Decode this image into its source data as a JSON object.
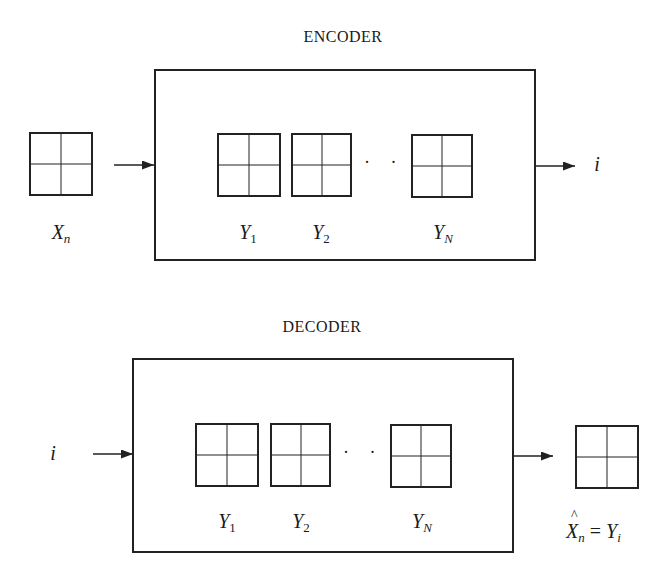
{
  "encoder": {
    "title": "ENCODER",
    "input_label_base": "X",
    "input_label_sub": "n",
    "codebook": [
      {
        "base": "Y",
        "sub": "1"
      },
      {
        "base": "Y",
        "sub": "2"
      },
      {
        "base": "Y",
        "sub": "N"
      }
    ],
    "ellipsis": "· · ·",
    "output_label": "i"
  },
  "decoder": {
    "title": "DECODER",
    "input_label": "i",
    "codebook": [
      {
        "base": "Y",
        "sub": "1"
      },
      {
        "base": "Y",
        "sub": "2"
      },
      {
        "base": "Y",
        "sub": "N"
      }
    ],
    "ellipsis": "· · ·",
    "output_label_lhs_base": "X",
    "output_label_lhs_sub": "n",
    "output_label_eq": " = ",
    "output_label_rhs_base": "Y",
    "output_label_rhs_sub": "i"
  },
  "colors": {
    "stroke": "#222222",
    "background": "#ffffff"
  }
}
